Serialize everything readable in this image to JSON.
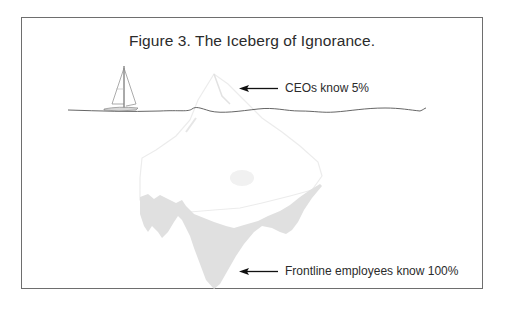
{
  "figure": {
    "title": "Figure 3. The Iceberg of Ignorance.",
    "annotations": [
      {
        "id": "top",
        "text": "CEOs know 5%",
        "points_to": "iceberg tip above water"
      },
      {
        "id": "bottom",
        "text": "Frontline employees know 100%",
        "points_to": "iceberg base below water"
      }
    ],
    "elements": {
      "sailboat-icon": "sailboat",
      "waterline": "wavy sea surface line",
      "iceberg": "iceberg with faint outline above water and gray-shaded submerged base",
      "arrow-icon": "left-pointing arrow"
    },
    "colors": {
      "frame_border": "#6e6e6e",
      "text": "#2b2b2b",
      "iceberg_fill": "#e0e0e0",
      "iceberg_outline": "#e6e6e6",
      "waterline": "#555555"
    }
  }
}
